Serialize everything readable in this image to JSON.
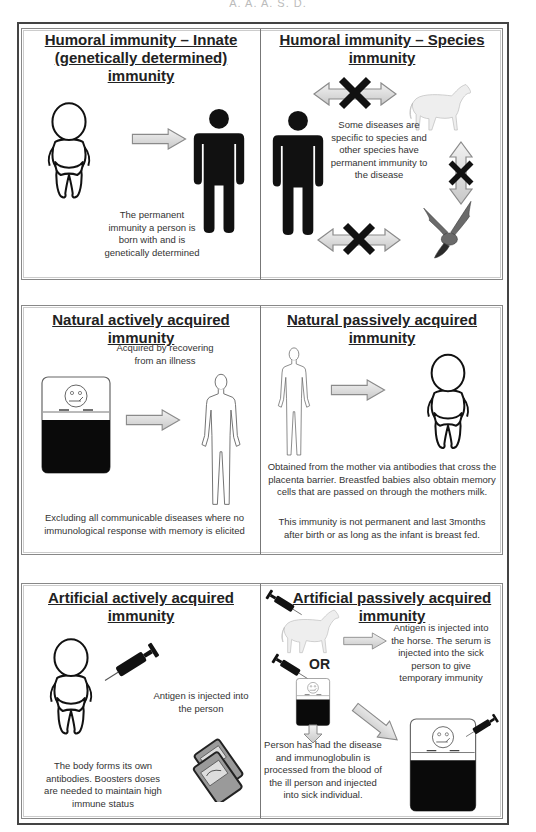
{
  "header_fragment": "A.  A.  A.   S.  D.",
  "panels": {
    "innate": {
      "title_line1": "Humoral immunity – Innate",
      "title_line2": "(genetically determined) immunity",
      "description": "The permanent immunity a person is born with and is genetically determined"
    },
    "species": {
      "title_line1": "Humoral immunity – Species",
      "title_line2": "immunity",
      "description": "Some diseases are specific to species and other species have permanent immunity to the disease"
    },
    "natural_active": {
      "title": "Natural actively acquired immunity",
      "subtitle": "Acquired by recovering from an illness",
      "description": "Excluding all communicable diseases where no immunological response with memory is elicited"
    },
    "natural_passive": {
      "title_line1": "Natural passively acquired",
      "title_line2": "immunity",
      "description": "Obtained from the mother via antibodies that cross the placenta barrier. Breastfed babies also obtain memory cells that are passed on through the mothers milk.",
      "note": "This immunity is not permanent and last 3months after birth or as long as the infant is breast fed."
    },
    "artificial_active": {
      "title_line1": "Artificial actively acquired",
      "title_line2": "immunity",
      "injection_text": "Antigen is injected into the person",
      "description": "The body forms its own antibodies. Boosters doses are needed to maintain high immune status"
    },
    "artificial_passive": {
      "title_line1": "Artificial passively acquired",
      "title_line2": "immunity",
      "horse_text": "Antigen is injected into the horse. The serum is injected into the sick person to give temporary immunity",
      "or_label": "OR",
      "person_text": "Person has had the disease and immunoglobulin is processed from the blood of the ill person and injected into sick individual."
    }
  },
  "colors": {
    "arrow_fill": "#d9d9d9",
    "arrow_stroke": "#8a8a8a",
    "figure": "#111111",
    "cross": "#111111",
    "border": "#444444"
  }
}
